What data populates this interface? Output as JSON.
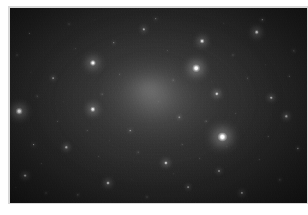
{
  "document": {
    "type": "astronomical-image",
    "title": "",
    "caption": "",
    "background_color": "#ffffff",
    "plate_border_color": "#d8d8d8"
  },
  "sky_image": {
    "name": "deep-sky-star-field-with-diffuse-galaxy",
    "frame": {
      "left": 10,
      "top": 8,
      "width": 297,
      "height": 195
    },
    "background_color": "#131313",
    "sky_gradient": [
      "#3a3a3a",
      "#2a2a2a",
      "#1d1d1d",
      "#141414",
      "#0d0d0d"
    ],
    "noise_description": "heavy photographic grain / CCD noise",
    "diffuse_object": {
      "name": "elliptical-galaxy-halo",
      "center_x_pct": 47,
      "center_y_pct": 42,
      "radius_x_pct": 40,
      "radius_y_pct": 44,
      "peak_brightness": 0.4,
      "core_color": "#bebebe"
    },
    "stars": [
      {
        "x_pct": 71.5,
        "y_pct": 66.0,
        "radius": 4.6,
        "brightness": 1.0,
        "color": "#ffffff"
      },
      {
        "x_pct": 62.6,
        "y_pct": 31.0,
        "radius": 3.8,
        "brightness": 0.95,
        "color": "#fbfbfb"
      },
      {
        "x_pct": 3.0,
        "y_pct": 53.0,
        "radius": 3.3,
        "brightness": 0.92,
        "color": "#f8f8f8"
      },
      {
        "x_pct": 27.9,
        "y_pct": 28.0,
        "radius": 3.1,
        "brightness": 0.9,
        "color": "#f6f6f6"
      },
      {
        "x_pct": 27.9,
        "y_pct": 52.0,
        "radius": 2.7,
        "brightness": 0.84,
        "color": "#f0f0f0"
      },
      {
        "x_pct": 64.6,
        "y_pct": 17.0,
        "radius": 2.4,
        "brightness": 0.8,
        "color": "#ececec"
      },
      {
        "x_pct": 83.1,
        "y_pct": 12.5,
        "radius": 2.3,
        "brightness": 0.78,
        "color": "#eaeaea"
      },
      {
        "x_pct": 69.6,
        "y_pct": 44.0,
        "radius": 2.2,
        "brightness": 0.74,
        "color": "#e4e4e4"
      },
      {
        "x_pct": 52.5,
        "y_pct": 79.5,
        "radius": 2.1,
        "brightness": 0.7,
        "color": "#e0e0e0"
      },
      {
        "x_pct": 33.0,
        "y_pct": 89.5,
        "radius": 2.0,
        "brightness": 0.68,
        "color": "#dedede"
      },
      {
        "x_pct": 5.0,
        "y_pct": 86.0,
        "radius": 1.9,
        "brightness": 0.64,
        "color": "#d8d8d8"
      },
      {
        "x_pct": 19.0,
        "y_pct": 71.5,
        "radius": 1.7,
        "brightness": 0.6,
        "color": "#d2d2d2"
      },
      {
        "x_pct": 45.0,
        "y_pct": 11.0,
        "radius": 1.7,
        "brightness": 0.58,
        "color": "#d0d0d0"
      },
      {
        "x_pct": 88.0,
        "y_pct": 46.0,
        "radius": 1.8,
        "brightness": 0.62,
        "color": "#d6d6d6"
      },
      {
        "x_pct": 93.0,
        "y_pct": 55.5,
        "radius": 1.7,
        "brightness": 0.58,
        "color": "#cfcfcf"
      },
      {
        "x_pct": 78.0,
        "y_pct": 95.0,
        "radius": 1.6,
        "brightness": 0.55,
        "color": "#cbcbcb"
      },
      {
        "x_pct": 70.5,
        "y_pct": 83.5,
        "radius": 1.5,
        "brightness": 0.52,
        "color": "#c6c6c6"
      },
      {
        "x_pct": 60.0,
        "y_pct": 92.0,
        "radius": 1.4,
        "brightness": 0.5,
        "color": "#c2c2c2"
      },
      {
        "x_pct": 14.5,
        "y_pct": 36.0,
        "radius": 1.4,
        "brightness": 0.48,
        "color": "#c0c0c0"
      },
      {
        "x_pct": 8.0,
        "y_pct": 70.0,
        "radius": 1.3,
        "brightness": 0.46,
        "color": "#bcbcbc"
      },
      {
        "x_pct": 40.5,
        "y_pct": 63.0,
        "radius": 1.3,
        "brightness": 0.44,
        "color": "#b8b8b8"
      },
      {
        "x_pct": 57.0,
        "y_pct": 56.0,
        "radius": 1.2,
        "brightness": 0.42,
        "color": "#b4b4b4"
      },
      {
        "x_pct": 35.0,
        "y_pct": 18.0,
        "radius": 1.2,
        "brightness": 0.42,
        "color": "#b4b4b4"
      },
      {
        "x_pct": 49.0,
        "y_pct": 5.5,
        "radius": 1.2,
        "brightness": 0.4,
        "color": "#b0b0b0"
      },
      {
        "x_pct": 85.0,
        "y_pct": 6.0,
        "radius": 1.2,
        "brightness": 0.4,
        "color": "#b0b0b0"
      },
      {
        "x_pct": 95.5,
        "y_pct": 22.0,
        "radius": 1.1,
        "brightness": 0.38,
        "color": "#acacac"
      },
      {
        "x_pct": 97.0,
        "y_pct": 72.0,
        "radius": 1.1,
        "brightness": 0.38,
        "color": "#acacac"
      },
      {
        "x_pct": 91.0,
        "y_pct": 88.0,
        "radius": 1.1,
        "brightness": 0.36,
        "color": "#a8a8a8"
      },
      {
        "x_pct": 23.0,
        "y_pct": 96.0,
        "radius": 1.1,
        "brightness": 0.36,
        "color": "#a8a8a8"
      },
      {
        "x_pct": 46.0,
        "y_pct": 97.0,
        "radius": 1.0,
        "brightness": 0.34,
        "color": "#a4a4a4"
      },
      {
        "x_pct": 12.0,
        "y_pct": 95.0,
        "radius": 1.0,
        "brightness": 0.34,
        "color": "#a4a4a4"
      },
      {
        "x_pct": 2.5,
        "y_pct": 24.0,
        "radius": 1.0,
        "brightness": 0.32,
        "color": "#a0a0a0"
      },
      {
        "x_pct": 20.0,
        "y_pct": 8.0,
        "radius": 1.0,
        "brightness": 0.32,
        "color": "#a0a0a0"
      },
      {
        "x_pct": 75.0,
        "y_pct": 24.0,
        "radius": 1.0,
        "brightness": 0.32,
        "color": "#a0a0a0"
      },
      {
        "x_pct": 55.0,
        "y_pct": 37.0,
        "radius": 0.9,
        "brightness": 0.3,
        "color": "#9c9c9c"
      },
      {
        "x_pct": 66.0,
        "y_pct": 58.0,
        "radius": 0.9,
        "brightness": 0.3,
        "color": "#9c9c9c"
      },
      {
        "x_pct": 31.0,
        "y_pct": 44.0,
        "radius": 0.9,
        "brightness": 0.28,
        "color": "#989898"
      },
      {
        "x_pct": 9.0,
        "y_pct": 45.0,
        "radius": 0.9,
        "brightness": 0.28,
        "color": "#989898"
      },
      {
        "x_pct": 43.0,
        "y_pct": 74.0,
        "radius": 0.9,
        "brightness": 0.28,
        "color": "#989898"
      },
      {
        "x_pct": 80.0,
        "y_pct": 36.0,
        "radius": 0.9,
        "brightness": 0.28,
        "color": "#989898"
      },
      {
        "x_pct": 87.0,
        "y_pct": 66.0,
        "radius": 0.8,
        "brightness": 0.26,
        "color": "#949494"
      },
      {
        "x_pct": 16.0,
        "y_pct": 58.0,
        "radius": 0.8,
        "brightness": 0.26,
        "color": "#949494"
      },
      {
        "x_pct": 37.0,
        "y_pct": 34.0,
        "radius": 0.8,
        "brightness": 0.25,
        "color": "#929292"
      },
      {
        "x_pct": 58.0,
        "y_pct": 70.0,
        "radius": 0.8,
        "brightness": 0.25,
        "color": "#929292"
      },
      {
        "x_pct": 72.0,
        "y_pct": 8.0,
        "radius": 0.8,
        "brightness": 0.25,
        "color": "#929292"
      },
      {
        "x_pct": 26.0,
        "y_pct": 63.0,
        "radius": 0.8,
        "brightness": 0.24,
        "color": "#8e8e8e"
      },
      {
        "x_pct": 50.0,
        "y_pct": 48.0,
        "radius": 0.8,
        "brightness": 0.24,
        "color": "#8e8e8e"
      },
      {
        "x_pct": 94.0,
        "y_pct": 35.0,
        "radius": 0.8,
        "brightness": 0.24,
        "color": "#8e8e8e"
      },
      {
        "x_pct": 64.0,
        "y_pct": 77.0,
        "radius": 0.7,
        "brightness": 0.22,
        "color": "#8a8a8a"
      },
      {
        "x_pct": 6.5,
        "y_pct": 13.0,
        "radius": 0.7,
        "brightness": 0.22,
        "color": "#8a8a8a"
      },
      {
        "x_pct": 30.0,
        "y_pct": 76.0,
        "radius": 0.7,
        "brightness": 0.22,
        "color": "#8a8a8a"
      },
      {
        "x_pct": 53.0,
        "y_pct": 22.0,
        "radius": 0.7,
        "brightness": 0.22,
        "color": "#8a8a8a"
      },
      {
        "x_pct": 41.0,
        "y_pct": 88.0,
        "radius": 0.7,
        "brightness": 0.2,
        "color": "#868686"
      },
      {
        "x_pct": 76.0,
        "y_pct": 54.0,
        "radius": 0.7,
        "brightness": 0.2,
        "color": "#868686"
      },
      {
        "x_pct": 22.0,
        "y_pct": 21.0,
        "radius": 0.7,
        "brightness": 0.2,
        "color": "#868686"
      },
      {
        "x_pct": 68.0,
        "y_pct": 38.0,
        "radius": 0.7,
        "brightness": 0.2,
        "color": "#868686"
      },
      {
        "x_pct": 10.5,
        "y_pct": 80.0,
        "radius": 0.7,
        "brightness": 0.2,
        "color": "#868686"
      },
      {
        "x_pct": 84.0,
        "y_pct": 78.0,
        "radius": 0.7,
        "brightness": 0.2,
        "color": "#868686"
      },
      {
        "x_pct": 47.0,
        "y_pct": 58.0,
        "radius": 0.6,
        "brightness": 0.18,
        "color": "#808080"
      },
      {
        "x_pct": 61.0,
        "y_pct": 14.0,
        "radius": 0.6,
        "brightness": 0.18,
        "color": "#808080"
      },
      {
        "x_pct": 17.5,
        "y_pct": 89.0,
        "radius": 0.6,
        "brightness": 0.18,
        "color": "#808080"
      },
      {
        "x_pct": 90.0,
        "y_pct": 17.0,
        "radius": 0.6,
        "brightness": 0.18,
        "color": "#808080"
      },
      {
        "x_pct": 36.0,
        "y_pct": 56.0,
        "radius": 0.6,
        "brightness": 0.17,
        "color": "#7c7c7c"
      },
      {
        "x_pct": 73.0,
        "y_pct": 71.0,
        "radius": 0.6,
        "brightness": 0.17,
        "color": "#7c7c7c"
      },
      {
        "x_pct": 55.0,
        "y_pct": 85.0,
        "radius": 0.6,
        "brightness": 0.17,
        "color": "#7c7c7c"
      },
      {
        "x_pct": 28.5,
        "y_pct": 6.0,
        "radius": 0.6,
        "brightness": 0.17,
        "color": "#7c7c7c"
      },
      {
        "x_pct": 4.0,
        "y_pct": 62.0,
        "radius": 0.6,
        "brightness": 0.16,
        "color": "#787878"
      },
      {
        "x_pct": 45.0,
        "y_pct": 44.0,
        "radius": 0.6,
        "brightness": 0.16,
        "color": "#787878"
      },
      {
        "x_pct": 79.0,
        "y_pct": 18.0,
        "radius": 0.6,
        "brightness": 0.16,
        "color": "#787878"
      },
      {
        "x_pct": 98.0,
        "y_pct": 45.0,
        "radius": 0.6,
        "brightness": 0.16,
        "color": "#787878"
      },
      {
        "x_pct": 13.0,
        "y_pct": 27.0,
        "radius": 0.6,
        "brightness": 0.16,
        "color": "#787878"
      },
      {
        "x_pct": 66.5,
        "y_pct": 94.0,
        "radius": 0.6,
        "brightness": 0.16,
        "color": "#787878"
      },
      {
        "x_pct": 39.0,
        "y_pct": 6.5,
        "radius": 0.5,
        "brightness": 0.15,
        "color": "#747474"
      },
      {
        "x_pct": 51.5,
        "y_pct": 66.0,
        "radius": 0.5,
        "brightness": 0.15,
        "color": "#747474"
      },
      {
        "x_pct": 24.0,
        "y_pct": 38.0,
        "radius": 0.5,
        "brightness": 0.15,
        "color": "#747474"
      },
      {
        "x_pct": 86.0,
        "y_pct": 29.0,
        "radius": 0.5,
        "brightness": 0.15,
        "color": "#747474"
      },
      {
        "x_pct": 7.0,
        "y_pct": 33.0,
        "radius": 0.5,
        "brightness": 0.14,
        "color": "#707070"
      },
      {
        "x_pct": 59.0,
        "y_pct": 48.0,
        "radius": 0.5,
        "brightness": 0.14,
        "color": "#707070"
      },
      {
        "x_pct": 33.5,
        "y_pct": 68.0,
        "radius": 0.5,
        "brightness": 0.14,
        "color": "#707070"
      },
      {
        "x_pct": 96.0,
        "y_pct": 63.0,
        "radius": 0.5,
        "brightness": 0.14,
        "color": "#707070"
      },
      {
        "x_pct": 70.0,
        "y_pct": 28.0,
        "radius": 0.5,
        "brightness": 0.14,
        "color": "#707070"
      },
      {
        "x_pct": 18.0,
        "y_pct": 48.0,
        "radius": 0.5,
        "brightness": 0.13,
        "color": "#6c6c6c"
      },
      {
        "x_pct": 48.5,
        "y_pct": 30.0,
        "radius": 0.5,
        "brightness": 0.13,
        "color": "#6c6c6c"
      },
      {
        "x_pct": 82.0,
        "y_pct": 59.0,
        "radius": 0.5,
        "brightness": 0.13,
        "color": "#6c6c6c"
      },
      {
        "x_pct": 2.0,
        "y_pct": 92.0,
        "radius": 0.5,
        "brightness": 0.13,
        "color": "#6c6c6c"
      },
      {
        "x_pct": 63.0,
        "y_pct": 2.5,
        "radius": 0.5,
        "brightness": 0.13,
        "color": "#6c6c6c"
      },
      {
        "x_pct": 92.5,
        "y_pct": 96.0,
        "radius": 0.5,
        "brightness": 0.13,
        "color": "#6c6c6c"
      }
    ]
  }
}
